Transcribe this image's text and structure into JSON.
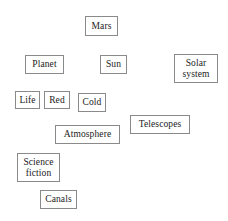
{
  "diagram": {
    "type": "concept-map",
    "background_color": "#ffffff",
    "border_color": "#8a8a8a",
    "text_color": "#1a1a1a",
    "canvas": {
      "width": 228,
      "height": 221
    },
    "nodes": [
      {
        "id": "mars",
        "label": "Mars",
        "x": 85,
        "y": 16,
        "w": 33,
        "h": 20,
        "font_size": 9.5
      },
      {
        "id": "planet",
        "label": "Planet",
        "x": 25,
        "y": 55,
        "w": 39,
        "h": 19,
        "font_size": 9.5
      },
      {
        "id": "sun",
        "label": "Sun",
        "x": 100,
        "y": 55,
        "w": 27,
        "h": 19,
        "font_size": 9.5
      },
      {
        "id": "solar-system",
        "label": "Solar\nsystem",
        "x": 174,
        "y": 54,
        "w": 44,
        "h": 29,
        "font_size": 9.5
      },
      {
        "id": "life",
        "label": "Life",
        "x": 15,
        "y": 91,
        "w": 25,
        "h": 18,
        "font_size": 9.5
      },
      {
        "id": "red",
        "label": "Red",
        "x": 44,
        "y": 91,
        "w": 26,
        "h": 18,
        "font_size": 9.5
      },
      {
        "id": "cold",
        "label": "Cold",
        "x": 78,
        "y": 93,
        "w": 28,
        "h": 19,
        "font_size": 9.5
      },
      {
        "id": "telescopes",
        "label": "Telescopes",
        "x": 130,
        "y": 115,
        "w": 60,
        "h": 19,
        "font_size": 9.5
      },
      {
        "id": "atmosphere",
        "label": "Atmosphere",
        "x": 55,
        "y": 125,
        "w": 65,
        "h": 19,
        "font_size": 9.5
      },
      {
        "id": "science-fiction",
        "label": "Science\nfiction",
        "x": 17,
        "y": 153,
        "w": 43,
        "h": 29,
        "font_size": 9.5
      },
      {
        "id": "canals",
        "label": "Canals",
        "x": 40,
        "y": 190,
        "w": 37,
        "h": 19,
        "font_size": 9.5
      }
    ]
  }
}
